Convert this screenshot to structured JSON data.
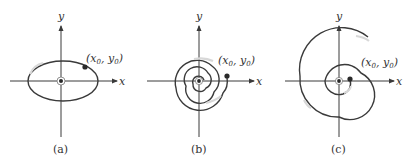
{
  "figure": {
    "panels": [
      {
        "id": "a",
        "caption": "(a)",
        "x_label": "x",
        "y_label": "y",
        "point_label_base": "(x",
        "point_label_sub0": "0",
        "point_label_mid": ", y",
        "point_label_sub1": "0",
        "point_label_end": ")",
        "trajectory": "closed ellipse around origin (center)"
      },
      {
        "id": "b",
        "caption": "(b)",
        "x_label": "x",
        "y_label": "y",
        "point_label_base": "(x",
        "point_label_sub0": "0",
        "point_label_mid": ", y",
        "point_label_sub1": "0",
        "point_label_end": ")",
        "trajectory": "spiral inward to origin (stable focus)"
      },
      {
        "id": "c",
        "caption": "(c)",
        "x_label": "x",
        "y_label": "y",
        "point_label_base": "(x",
        "point_label_sub0": "0",
        "point_label_mid": ", y",
        "point_label_sub1": "0",
        "point_label_end": ")",
        "trajectory": "spiral outward from origin (unstable focus)"
      }
    ],
    "colors": {
      "stroke": "#3a3a3a",
      "fade": "#cfcfcf",
      "text": "#333333"
    }
  }
}
